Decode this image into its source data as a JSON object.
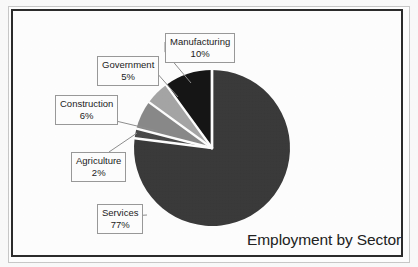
{
  "chart_data": {
    "type": "pie",
    "title": "Employment by Sector",
    "xlabel": "",
    "ylabel": "",
    "legend_position": "none",
    "labels_style": "callout-boxes-with-leader-lines",
    "categories": [
      "Services",
      "Manufacturing",
      "Construction",
      "Government",
      "Agriculture"
    ],
    "values": [
      77,
      10,
      6,
      5,
      2
    ],
    "value_unit": "%",
    "slices": [
      {
        "label": "Services",
        "value": 77,
        "display": "77%",
        "color": "#3a3a3a"
      },
      {
        "label": "Manufacturing",
        "value": 10,
        "display": "10%",
        "color": "#151515"
      },
      {
        "label": "Construction",
        "value": 6,
        "display": "6%",
        "color": "#8a8a8a"
      },
      {
        "label": "Government",
        "value": 5,
        "display": "5%",
        "color": "#a6a6a6"
      },
      {
        "label": "Agriculture",
        "value": 2,
        "display": "2%",
        "color": "#4a4a4a"
      }
    ]
  },
  "chart": {
    "title": "Employment by Sector",
    "callouts": {
      "manufacturing": {
        "name": "Manufacturing",
        "percent": "10%"
      },
      "government": {
        "name": "Government",
        "percent": "5%"
      },
      "construction": {
        "name": "Construction",
        "percent": "6%"
      },
      "agriculture": {
        "name": "Agriculture",
        "percent": "2%"
      },
      "services": {
        "name": "Services",
        "percent": "77%"
      }
    }
  },
  "colors": {
    "services": "#3a3a3a",
    "manufacturing": "#151515",
    "construction": "#8a8a8a",
    "government": "#a6a6a6",
    "agriculture": "#4a4a4a",
    "frame": "#2b2b2b",
    "background": "#ffffff",
    "callout_border": "#9a9a9a",
    "leader_line": "#8f8f8f"
  }
}
